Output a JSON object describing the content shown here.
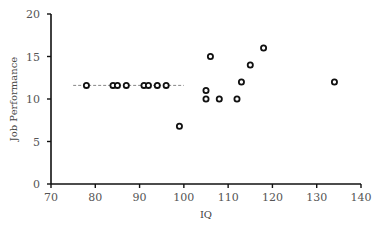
{
  "chart_data": {
    "type": "scatter",
    "title": "",
    "xlabel": "IQ",
    "ylabel": "Job Performance",
    "xlim": [
      70,
      140
    ],
    "ylim": [
      0,
      20
    ],
    "xticks": [
      70,
      80,
      90,
      100,
      110,
      120,
      130,
      140
    ],
    "yticks": [
      0,
      5,
      10,
      15,
      20
    ],
    "grid": false,
    "legend": null,
    "series": [
      {
        "name": "Employees",
        "marker": "open-circle",
        "points": [
          {
            "x": 78,
            "y": 11.6
          },
          {
            "x": 84,
            "y": 11.6
          },
          {
            "x": 85,
            "y": 11.6
          },
          {
            "x": 87,
            "y": 11.6
          },
          {
            "x": 91,
            "y": 11.6
          },
          {
            "x": 92,
            "y": 11.6
          },
          {
            "x": 94,
            "y": 11.6
          },
          {
            "x": 96,
            "y": 11.6
          },
          {
            "x": 99,
            "y": 6.8
          },
          {
            "x": 105,
            "y": 11
          },
          {
            "x": 105,
            "y": 10
          },
          {
            "x": 106,
            "y": 15
          },
          {
            "x": 108,
            "y": 10
          },
          {
            "x": 112,
            "y": 10
          },
          {
            "x": 113,
            "y": 12
          },
          {
            "x": 115,
            "y": 14
          },
          {
            "x": 118,
            "y": 16
          },
          {
            "x": 134,
            "y": 12
          }
        ]
      }
    ],
    "annotations": [
      {
        "type": "dashed-hline",
        "y": 11.6,
        "x_start": 75,
        "x_end": 100
      }
    ]
  },
  "colors": {
    "axis": "#111111",
    "marker": "#111111",
    "dashed_line": "#888888",
    "tick_text": "#555555"
  }
}
